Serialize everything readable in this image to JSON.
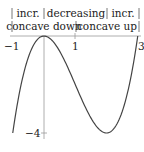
{
  "diagram": {
    "function": "f(x) = x^3 - 3x^2",
    "x_range": [
      -1,
      3
    ],
    "y_range": [
      -4,
      0
    ],
    "monotonicity_row": [
      {
        "label": "incr.",
        "interval": [
          -1,
          0
        ]
      },
      {
        "label": "decreasing",
        "interval": [
          0,
          2
        ]
      },
      {
        "label": "incr.",
        "interval": [
          2,
          3
        ]
      }
    ],
    "concavity_row": [
      {
        "label": "concave down",
        "interval": [
          -1,
          1
        ]
      },
      {
        "label": "concave up",
        "interval": [
          1,
          3
        ]
      }
    ],
    "x_tick_labels": [
      "−1",
      "1",
      "3"
    ],
    "y_tick_labels": [
      "−4"
    ],
    "colors": {
      "curve": "#444444",
      "axis": "#999999",
      "text": "#222222"
    }
  }
}
